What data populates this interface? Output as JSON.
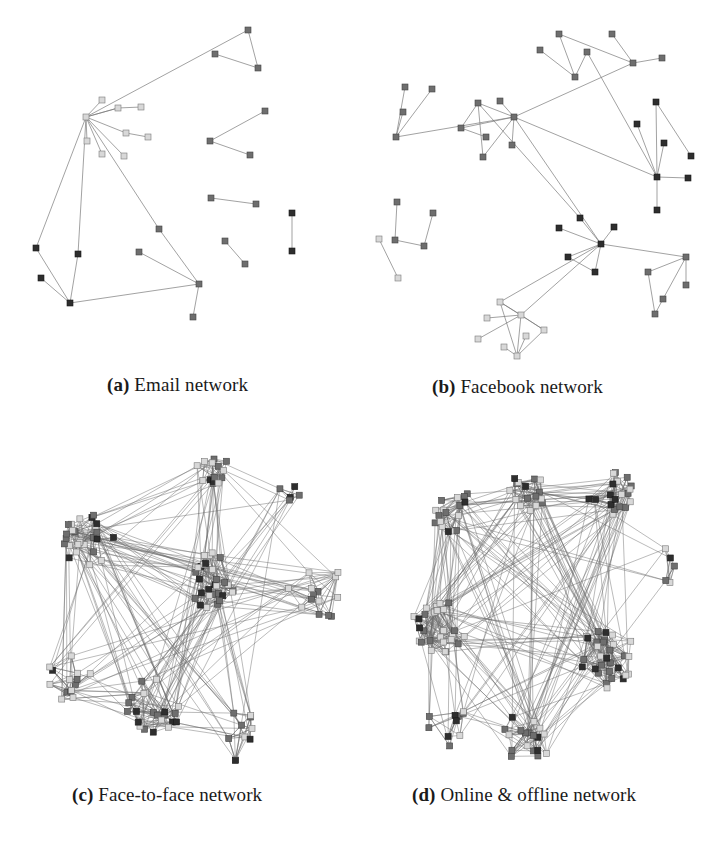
{
  "figure": {
    "panels": [
      {
        "id": "a",
        "tag": "(a)",
        "caption": "Email network",
        "caption_pos": [
          107,
          374
        ],
        "nodes": [
          [
            86,
            117,
            "l"
          ],
          [
            248,
            30,
            "m"
          ],
          [
            215,
            54,
            "m"
          ],
          [
            258,
            68,
            "m"
          ],
          [
            102,
            100,
            "l"
          ],
          [
            118,
            108,
            "l"
          ],
          [
            141,
            107,
            "l"
          ],
          [
            126,
            133,
            "l"
          ],
          [
            148,
            137,
            "l"
          ],
          [
            87,
            141,
            "l"
          ],
          [
            102,
            154,
            "l"
          ],
          [
            124,
            156,
            "l"
          ],
          [
            265,
            111,
            "m"
          ],
          [
            210,
            141,
            "m"
          ],
          [
            250,
            155,
            "m"
          ],
          [
            211,
            198,
            "m"
          ],
          [
            256,
            204,
            "m"
          ],
          [
            292,
            213,
            "d"
          ],
          [
            292,
            251,
            "d"
          ],
          [
            36,
            248,
            "d"
          ],
          [
            41,
            278,
            "d"
          ],
          [
            70,
            303,
            "d"
          ],
          [
            78,
            254,
            "d"
          ],
          [
            139,
            252,
            "m"
          ],
          [
            159,
            229,
            "m"
          ],
          [
            199,
            284,
            "m"
          ],
          [
            193,
            317,
            "m"
          ],
          [
            225,
            241,
            "m"
          ],
          [
            245,
            264,
            "m"
          ]
        ],
        "edges": [
          [
            0,
            1
          ],
          [
            1,
            3
          ],
          [
            2,
            3
          ],
          [
            0,
            4
          ],
          [
            0,
            5
          ],
          [
            5,
            6
          ],
          [
            0,
            7
          ],
          [
            7,
            8
          ],
          [
            0,
            9
          ],
          [
            0,
            10
          ],
          [
            0,
            11
          ],
          [
            0,
            5
          ],
          [
            12,
            13
          ],
          [
            13,
            14
          ],
          [
            15,
            16
          ],
          [
            17,
            18
          ],
          [
            0,
            19
          ],
          [
            19,
            21
          ],
          [
            20,
            21
          ],
          [
            0,
            22
          ],
          [
            22,
            21
          ],
          [
            21,
            25
          ],
          [
            23,
            25
          ],
          [
            0,
            24
          ],
          [
            24,
            25
          ],
          [
            25,
            26
          ],
          [
            27,
            28
          ]
        ]
      },
      {
        "id": "b",
        "tag": "(b)",
        "caption": "Facebook network",
        "caption_pos": [
          432,
          376
        ],
        "nodes": [
          [
            559,
            34,
            "m"
          ],
          [
            612,
            34,
            "m"
          ],
          [
            540,
            50,
            "m"
          ],
          [
            587,
            52,
            "m"
          ],
          [
            633,
            63,
            "m"
          ],
          [
            662,
            58,
            "m"
          ],
          [
            575,
            77,
            "m"
          ],
          [
            405,
            87,
            "m"
          ],
          [
            432,
            89,
            "m"
          ],
          [
            403,
            112,
            "m"
          ],
          [
            396,
            137,
            "m"
          ],
          [
            478,
            103,
            "m"
          ],
          [
            500,
            101,
            "m"
          ],
          [
            514,
            117,
            "m"
          ],
          [
            461,
            128,
            "m"
          ],
          [
            486,
            137,
            "m"
          ],
          [
            512,
            145,
            "m"
          ],
          [
            483,
            157,
            "m"
          ],
          [
            656,
            102,
            "d"
          ],
          [
            637,
            124,
            "d"
          ],
          [
            664,
            143,
            "d"
          ],
          [
            691,
            156,
            "d"
          ],
          [
            657,
            177,
            "d"
          ],
          [
            688,
            178,
            "d"
          ],
          [
            657,
            210,
            "d"
          ],
          [
            397,
            202,
            "m"
          ],
          [
            433,
            213,
            "m"
          ],
          [
            379,
            239,
            "l"
          ],
          [
            395,
            240,
            "m"
          ],
          [
            424,
            246,
            "m"
          ],
          [
            398,
            278,
            "l"
          ],
          [
            580,
            218,
            "d"
          ],
          [
            559,
            228,
            "d"
          ],
          [
            614,
            227,
            "d"
          ],
          [
            601,
            244,
            "d"
          ],
          [
            568,
            257,
            "d"
          ],
          [
            595,
            272,
            "d"
          ],
          [
            686,
            257,
            "m"
          ],
          [
            648,
            272,
            "m"
          ],
          [
            686,
            285,
            "m"
          ],
          [
            663,
            299,
            "m"
          ],
          [
            655,
            314,
            "m"
          ],
          [
            500,
            302,
            "l"
          ],
          [
            521,
            315,
            "l"
          ],
          [
            487,
            318,
            "l"
          ],
          [
            478,
            339,
            "l"
          ],
          [
            544,
            330,
            "l"
          ],
          [
            526,
            336,
            "l"
          ],
          [
            504,
            347,
            "l"
          ],
          [
            517,
            356,
            "l"
          ]
        ],
        "edges": [
          [
            1,
            4
          ],
          [
            0,
            4
          ],
          [
            0,
            6
          ],
          [
            2,
            6
          ],
          [
            3,
            6
          ],
          [
            3,
            22
          ],
          [
            4,
            5
          ],
          [
            4,
            13
          ],
          [
            7,
            10
          ],
          [
            8,
            10
          ],
          [
            9,
            10
          ],
          [
            11,
            13
          ],
          [
            12,
            13
          ],
          [
            13,
            10
          ],
          [
            14,
            13
          ],
          [
            11,
            14
          ],
          [
            14,
            15
          ],
          [
            11,
            17
          ],
          [
            13,
            16
          ],
          [
            13,
            17
          ],
          [
            13,
            22
          ],
          [
            13,
            34
          ],
          [
            11,
            31
          ],
          [
            18,
            22
          ],
          [
            19,
            22
          ],
          [
            20,
            22
          ],
          [
            18,
            21
          ],
          [
            22,
            23
          ],
          [
            22,
            24
          ],
          [
            25,
            28
          ],
          [
            26,
            29
          ],
          [
            27,
            30
          ],
          [
            28,
            29
          ],
          [
            31,
            34
          ],
          [
            32,
            34
          ],
          [
            33,
            34
          ],
          [
            34,
            35
          ],
          [
            34,
            36
          ],
          [
            35,
            36
          ],
          [
            34,
            37
          ],
          [
            37,
            38
          ],
          [
            37,
            39
          ],
          [
            37,
            40
          ],
          [
            38,
            41
          ],
          [
            40,
            41
          ],
          [
            34,
            42
          ],
          [
            34,
            43
          ],
          [
            42,
            43
          ],
          [
            42,
            46
          ],
          [
            43,
            44
          ],
          [
            43,
            45
          ],
          [
            42,
            49
          ],
          [
            43,
            49
          ],
          [
            47,
            49
          ],
          [
            46,
            49
          ],
          [
            43,
            46
          ],
          [
            48,
            49
          ]
        ]
      },
      {
        "id": "c",
        "tag": "(c)",
        "caption": "Face-to-face network",
        "caption_pos": [
          72,
          784
        ],
        "clusters": [
          {
            "cx": 212,
            "cy": 470,
            "r": 18,
            "n": 14,
            "seed": 3
          },
          {
            "cx": 88,
            "cy": 540,
            "r": 26,
            "n": 26,
            "seed": 7
          },
          {
            "cx": 212,
            "cy": 580,
            "r": 28,
            "n": 30,
            "seed": 11
          },
          {
            "cx": 72,
            "cy": 680,
            "r": 26,
            "n": 14,
            "seed": 13
          },
          {
            "cx": 152,
            "cy": 705,
            "r": 30,
            "n": 22,
            "seed": 17
          },
          {
            "cx": 318,
            "cy": 590,
            "r": 30,
            "n": 14,
            "seed": 19
          },
          {
            "cx": 290,
            "cy": 490,
            "r": 12,
            "n": 5,
            "seed": 23
          },
          {
            "cx": 235,
            "cy": 735,
            "r": 26,
            "n": 10,
            "seed": 29
          }
        ],
        "inter_edges": 190,
        "seed": 101
      },
      {
        "id": "d",
        "tag": "(d)",
        "caption": "Online & offline network",
        "caption_pos": [
          412,
          784
        ],
        "clusters": [
          {
            "cx": 455,
            "cy": 510,
            "r": 24,
            "n": 18,
            "seed": 5
          },
          {
            "cx": 527,
            "cy": 492,
            "r": 20,
            "n": 16,
            "seed": 9
          },
          {
            "cx": 612,
            "cy": 495,
            "r": 24,
            "n": 20,
            "seed": 15
          },
          {
            "cx": 440,
            "cy": 625,
            "r": 28,
            "n": 32,
            "seed": 21
          },
          {
            "cx": 606,
            "cy": 658,
            "r": 30,
            "n": 34,
            "seed": 27
          },
          {
            "cx": 527,
            "cy": 738,
            "r": 26,
            "n": 18,
            "seed": 31
          },
          {
            "cx": 448,
            "cy": 725,
            "r": 22,
            "n": 10,
            "seed": 33
          },
          {
            "cx": 670,
            "cy": 565,
            "r": 22,
            "n": 5,
            "seed": 37
          }
        ],
        "inter_edges": 210,
        "seed": 202
      }
    ]
  }
}
